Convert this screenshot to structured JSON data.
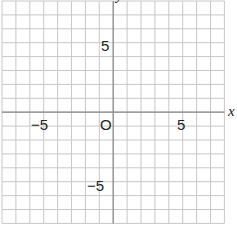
{
  "diagram": {
    "type": "coordinate-grid",
    "grid": {
      "x_min": -8,
      "x_max": 8,
      "y_min": -8,
      "y_max": 8,
      "step": 1,
      "line_color": "#c8c8c8",
      "axis_color": "#888888"
    },
    "axis_labels": {
      "x": "x",
      "y": "y"
    },
    "origin_label": "O",
    "ticks": {
      "x_neg": "−5",
      "x_pos": "5",
      "y_pos": "5",
      "y_neg": "−5"
    }
  }
}
